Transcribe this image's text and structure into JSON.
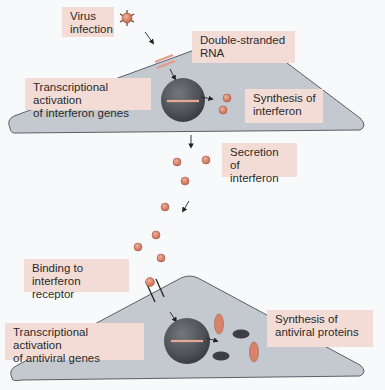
{
  "labels": {
    "virus_infection": "Virus\ninfection",
    "double_stranded_rna": "Double-stranded\nRNA",
    "transcriptional_activation_interferon": "Transcriptional activation\nof interferon genes",
    "synthesis_of_interferon": "Synthesis of\ninterferon",
    "secretion_of_interferon": "Secretion of\ninterferon",
    "binding_to_receptor": "Binding to\ninterferon receptor",
    "transcriptional_activation_antiviral": "Transcriptional activation\nof antiviral genes",
    "synthesis_of_antiviral_proteins": "Synthesis of\nantiviral proteins"
  },
  "colors": {
    "background": "#f7f9fb",
    "label_fill": "#f3dcd6",
    "cell_fill": "#c3c9cf",
    "cell_outline": "#3a3f45",
    "nucleus": "#4a4d52",
    "interferon": "#d9826a",
    "rna_strand": "#e49b8a",
    "antiviral_dark": "#3c3f44"
  },
  "icons": {
    "virus": "virus-icon",
    "interferon_molecule": "interferon-dot-icon",
    "receptor": "receptor-icon",
    "antiviral_protein": "antiviral-protein-icon"
  }
}
